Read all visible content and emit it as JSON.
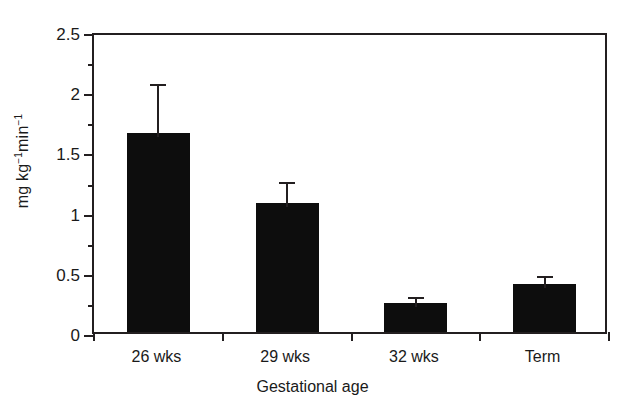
{
  "chart_data": {
    "type": "bar",
    "title": "",
    "subtitle": "",
    "xlabel": "Gestational age",
    "ylabel": "mg kg⁻¹min⁻¹",
    "ylabel_parts": {
      "prefix": "mg kg",
      "sup1": "−1",
      "middle": "min",
      "sup2": "−1"
    },
    "categories": [
      "26 wks",
      "29 wks",
      "32 wks",
      "Term"
    ],
    "values": [
      1.65,
      1.07,
      0.24,
      0.4
    ],
    "errors_upper": [
      0.44,
      0.21,
      0.08,
      0.1
    ],
    "error_tops": [
      2.09,
      1.28,
      0.32,
      0.5
    ],
    "ylim": [
      0,
      2.5
    ],
    "ytick_labels": [
      "0",
      "0.5",
      "1",
      "1.5",
      "2",
      "2.5"
    ],
    "ytick_values": [
      0,
      0.5,
      1,
      1.5,
      2,
      2.5
    ],
    "yminor_values": [
      0.25,
      0.75,
      1.25,
      1.75,
      2.25
    ],
    "grid": false,
    "legend": false,
    "legend_position": "none",
    "bar_color": "#0d0d0d",
    "axis_color": "#231f20",
    "background_color": "#ffffff",
    "error_bar_direction": "upper-only"
  }
}
